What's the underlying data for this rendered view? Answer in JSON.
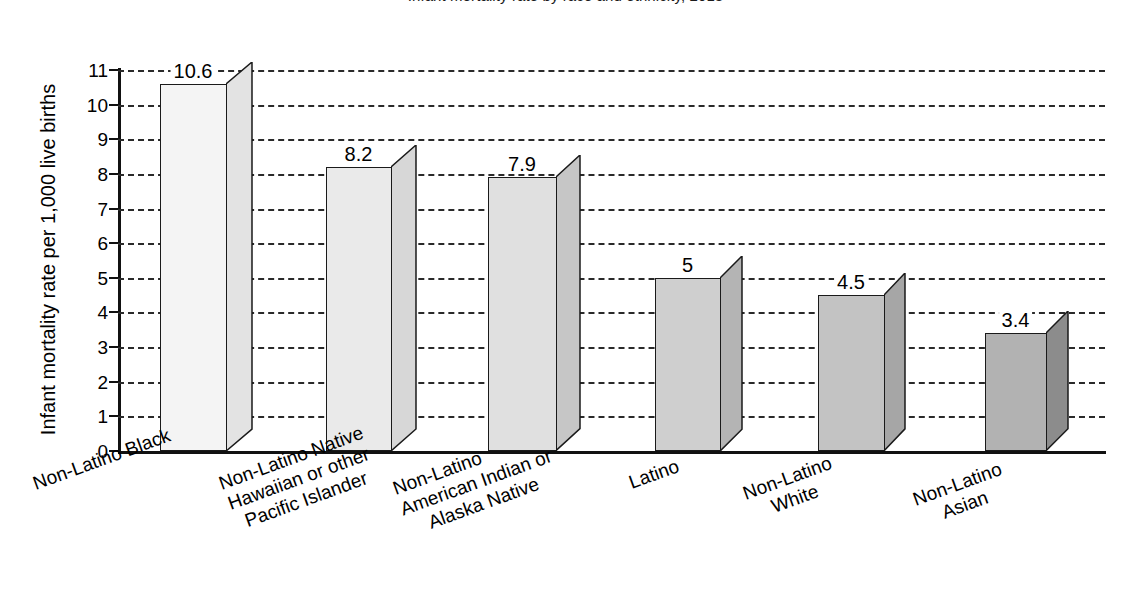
{
  "chart_data": {
    "type": "bar",
    "title": "Infant mortality rate by race and ethnicity, 2018",
    "xlabel": "",
    "ylabel": "Infant mortality rate per 1,000 live births",
    "ylim": [
      0,
      11
    ],
    "ytick_step": 1,
    "grid": true,
    "legend": "none",
    "value_labels": true,
    "categories": [
      "Non-Latino Black",
      "Non-Latino Native Hawaiian or other Pacific Islander",
      "Non-Latino American Indian or Alaska Native",
      "Latino",
      "Non-Latino White",
      "Non-Latino Asian"
    ],
    "values": [
      10.6,
      8.2,
      7.9,
      5,
      4.5,
      3.4
    ],
    "value_label_text": [
      "10.6",
      "8.2",
      "7.9",
      "5",
      "4.5",
      "3.4"
    ],
    "ytick_labels": [
      "0",
      "1",
      "2",
      "3",
      "4",
      "5",
      "6",
      "7",
      "8",
      "9",
      "10",
      "11"
    ]
  },
  "axis": {
    "y_title": "Infant mortality rate per 1,000 live births"
  },
  "categories_wrapped": [
    [
      "Non-Latino Black"
    ],
    [
      "Non-Latino Native",
      "Hawaiian or other",
      "Pacific Islander"
    ],
    [
      "Non-Latino",
      "American Indian or",
      "Alaska Native"
    ],
    [
      "Latino"
    ],
    [
      "Non-Latino",
      "White"
    ],
    [
      "Non-Latino",
      "Asian"
    ]
  ],
  "colors": {
    "axis": "#111111",
    "grid": "#2a2a2a",
    "text": "#000000",
    "bar_faces": [
      "#f4f4f4",
      "#eaeaea",
      "#e0e0e0",
      "#cfcfcf",
      "#c3c3c3",
      "#b2b2b2"
    ],
    "bar_sides": [
      "#e3e3e3",
      "#d7d7d7",
      "#c6c6c6",
      "#b4b4b4",
      "#a6a6a6",
      "#8c8c8c"
    ]
  }
}
